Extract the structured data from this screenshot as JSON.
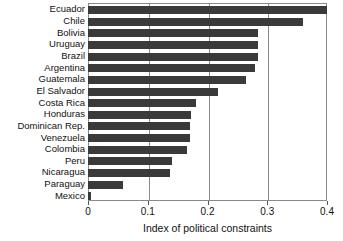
{
  "chart_data": {
    "type": "bar",
    "orientation": "horizontal",
    "title": "",
    "xlabel": "Index of political constraints",
    "ylabel": "",
    "xlim": [
      0,
      0.4
    ],
    "xticks": [
      "0",
      "0.1",
      "0.2",
      "0.3",
      "0.4"
    ],
    "xtick_values": [
      0,
      0.1,
      0.2,
      0.3,
      0.4
    ],
    "grid": "vertical",
    "legend": "none",
    "bar_color": "#3a3a3a",
    "frame_color": "#8a8a8a",
    "categories": [
      "Ecuador",
      "Chile",
      "Bolivia",
      "Uruguay",
      "Brazil",
      "Argentina",
      "Guatemala",
      "El Salvador",
      "Costa Rica",
      "Honduras",
      "Dominican Rep.",
      "Venezuela",
      "Colombia",
      "Peru",
      "Nicaragua",
      "Paraguay",
      "Mexico"
    ],
    "values": [
      0.4,
      0.36,
      0.285,
      0.285,
      0.285,
      0.28,
      0.265,
      0.218,
      0.18,
      0.172,
      0.17,
      0.17,
      0.165,
      0.14,
      0.138,
      0.059,
      0.005
    ]
  }
}
